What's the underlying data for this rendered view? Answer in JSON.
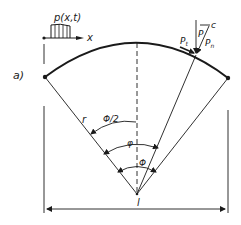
{
  "figure": {
    "panel_label": "a)",
    "load_label": "p(x,t)",
    "x_axis_label": "x",
    "radius_label": "r",
    "half_angle_label": "Φ/2",
    "angle_phi_small_label": "φ",
    "angle_phi_label": "Φ",
    "span_label": "l",
    "force_label": "P",
    "tangential_force_label": "P_t",
    "tangential_force_main": "P",
    "tangential_force_sub": "t",
    "normal_force_main": "P",
    "normal_force_sub": "n",
    "offset_label": "c",
    "colors": {
      "ink": "#1a1a1a",
      "background": "#ffffff"
    }
  }
}
